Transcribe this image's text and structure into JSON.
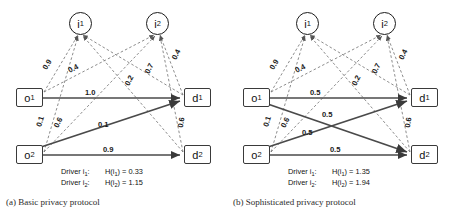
{
  "figure": {
    "panels": [
      {
        "id": "a",
        "caption": "(a) Basic privacy protocol",
        "nodes": {
          "o1": "o",
          "o1_sub": "1",
          "o2": "o",
          "o2_sub": "2",
          "d1": "d",
          "d1_sub": "1",
          "d2": "d",
          "d2_sub": "2",
          "i1": "i",
          "i1_sub": "1",
          "i2": "i",
          "i2_sub": "2"
        },
        "flow_labels": {
          "o1_d1": "1.0",
          "o2_d1": "0.1",
          "o2_d2": "0.9"
        },
        "driver_labels": {
          "o1_i1": "0.9",
          "o1_i2": "0.4",
          "o2_i1": "0.1",
          "o2_i2": "0.6",
          "d1_i2": "0.4",
          "d1_i1": "0.7",
          "d2_i1": "0.2",
          "d2_i2": "0.6"
        },
        "legend": [
          {
            "driver": "Driver i",
            "driver_sub": "1",
            "entropy": "H(i",
            "entropy_sub": "1",
            "entropy_val": ") = 0.33"
          },
          {
            "driver": "Driver i",
            "driver_sub": "2",
            "entropy": "H(i",
            "entropy_sub": "2",
            "entropy_val": ") = 1.15"
          }
        ]
      },
      {
        "id": "b",
        "caption": "(b) Sophisticated privacy protocol",
        "nodes": {
          "o1": "o",
          "o1_sub": "1",
          "o2": "o",
          "o2_sub": "2",
          "d1": "d",
          "d1_sub": "1",
          "d2": "d",
          "d2_sub": "2",
          "i1": "i",
          "i1_sub": "1",
          "i2": "i",
          "i2_sub": "2"
        },
        "flow_labels": {
          "o1_d1": "0.5",
          "o1_d2": "0.5",
          "o2_d1": "0.5",
          "o2_d2": "0.5"
        },
        "driver_labels": {
          "o1_i1": "0.9",
          "o1_i2": "0.4",
          "o2_i1": "0.1",
          "o2_i2": "0.6",
          "d1_i2": "0.4",
          "d1_i1": "0.7",
          "d2_i1": "0.2",
          "d2_i2": "0.6"
        },
        "legend": [
          {
            "driver": "Driver i",
            "driver_sub": "1",
            "entropy": "H(i",
            "entropy_sub": "1",
            "entropy_val": ") = 1.35"
          },
          {
            "driver": "Driver i",
            "driver_sub": "2",
            "entropy": "H(i",
            "entropy_sub": "2",
            "entropy_val": ") = 1.94"
          }
        ]
      }
    ],
    "colors": {
      "solid_edge": "#4a4a4a",
      "dashed_edge": "#6f6f6f",
      "node_stroke": "#3a3a3a",
      "text": "#111111"
    }
  }
}
